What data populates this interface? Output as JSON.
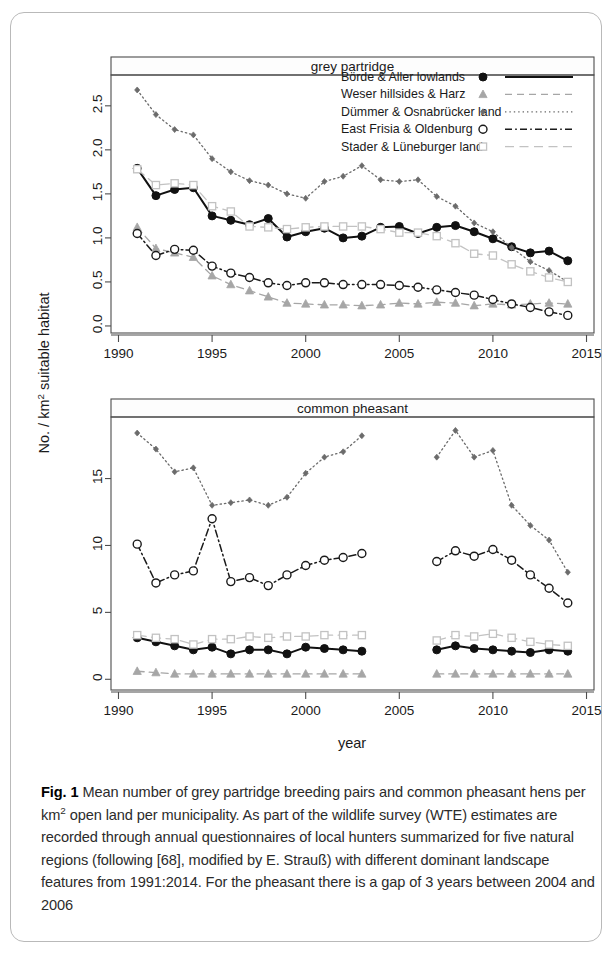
{
  "figure": {
    "label": "Fig. 1",
    "caption": "Mean number of grey partridge breeding pairs and common pheasant hens per km² open land per municipality. As part of the wildlife survey (WTE) estimates are recorded through annual questionnaires of local hunters summarized for five natural regions (following [68], modified by E. Strauß) with different dominant landscape features from 1991:2014. For the pheasant there is a gap of 3 years between 2004 and 2006",
    "caption_parts": {
      "before_sup": "Mean number of grey partridge breeding pairs and common pheasant hens per km",
      "sup": "2",
      "after_sup": " open land per municipality. As part of the wildlife survey (WTE) estimates are recorded through annual questionnaires of local hunters summarized for five natural regions (following [68], modified by E. Strauß) with different dominant landscape features from 1991:2014. For the pheasant there is a gap of 3 years between 2004 and 2006"
    }
  },
  "axes": {
    "ylabel_prefix": "No. / km",
    "ylabel_sup": "2",
    "ylabel_suffix": " suitable habitat",
    "ylabel_full": "No. / km² suitable habitat",
    "xlabel": "year"
  },
  "legend": {
    "position": "top-panel-upper-right",
    "entries": [
      {
        "label": "Börde & Aller lowlands",
        "marker": "filled-circle",
        "line": "solid",
        "color": "#111111"
      },
      {
        "label": "Weser hillsides & Harz",
        "marker": "filled-triangle",
        "line": "dashed",
        "color": "#a6a6a6"
      },
      {
        "label": "Dümmer & Osnabrücker land",
        "marker": "small-diamond",
        "line": "dotted",
        "color": "#6b6b6b"
      },
      {
        "label": "East Frisia & Oldenburg",
        "marker": "open-circle",
        "line": "dashdot",
        "color": "#1a1a1a"
      },
      {
        "label": "Stader & Lüneburger land",
        "marker": "open-square",
        "line": "longdash",
        "color": "#c2c2c2"
      }
    ]
  },
  "chart_data": [
    {
      "type": "line",
      "title": "grey partridge",
      "panel": "top",
      "xlabel": "year",
      "ylabel": "No. / km² suitable habitat",
      "xlim": [
        1989.6,
        2015.4
      ],
      "ylim": [
        -0.08,
        2.85
      ],
      "xticks": [
        1990,
        1995,
        2000,
        2005,
        2010,
        2015
      ],
      "yticks": [
        0.0,
        0.5,
        1.0,
        1.5,
        2.0,
        2.5
      ],
      "ytick_labels": [
        "0.0",
        "0.5",
        "1.0",
        "1.5",
        "2.0",
        "2.5"
      ],
      "grid": false,
      "x": [
        1991,
        1992,
        1993,
        1994,
        1995,
        1996,
        1997,
        1998,
        1999,
        2000,
        2001,
        2002,
        2003,
        2004,
        2005,
        2006,
        2007,
        2008,
        2009,
        2010,
        2011,
        2012,
        2013,
        2014
      ],
      "series": [
        {
          "name": "Börde & Aller lowlands",
          "values": [
            1.79,
            1.48,
            1.55,
            1.57,
            1.25,
            1.2,
            1.15,
            1.22,
            1.01,
            1.07,
            1.11,
            1.0,
            1.02,
            1.12,
            1.13,
            1.05,
            1.12,
            1.14,
            1.07,
            0.99,
            0.9,
            0.83,
            0.85,
            0.74
          ]
        },
        {
          "name": "Weser hillsides & Harz",
          "values": [
            1.12,
            0.88,
            0.83,
            0.78,
            0.57,
            0.47,
            0.4,
            0.33,
            0.26,
            0.25,
            0.24,
            0.24,
            0.23,
            0.24,
            0.26,
            0.25,
            0.27,
            0.26,
            0.23,
            0.25,
            0.24,
            0.25,
            0.26,
            0.25
          ]
        },
        {
          "name": "Dümmer & Osnabrücker land",
          "values": [
            2.68,
            2.4,
            2.23,
            2.17,
            1.9,
            1.75,
            1.65,
            1.6,
            1.5,
            1.45,
            1.64,
            1.7,
            1.82,
            1.66,
            1.64,
            1.66,
            1.47,
            1.36,
            1.17,
            1.07,
            0.89,
            0.73,
            0.63,
            0.5
          ]
        },
        {
          "name": "East Frisia & Oldenburg",
          "values": [
            1.05,
            0.8,
            0.87,
            0.86,
            0.68,
            0.6,
            0.55,
            0.49,
            0.46,
            0.49,
            0.49,
            0.47,
            0.47,
            0.47,
            0.46,
            0.44,
            0.41,
            0.38,
            0.35,
            0.3,
            0.25,
            0.21,
            0.16,
            0.12
          ]
        },
        {
          "name": "Stader & Lüneburger land",
          "values": [
            1.78,
            1.6,
            1.62,
            1.6,
            1.36,
            1.3,
            1.13,
            1.12,
            1.1,
            1.12,
            1.13,
            1.13,
            1.13,
            1.1,
            1.06,
            1.06,
            1.02,
            0.94,
            0.82,
            0.8,
            0.7,
            0.62,
            0.55,
            0.5
          ]
        }
      ]
    },
    {
      "type": "line",
      "title": "common pheasant",
      "panel": "bottom",
      "xlabel": "year",
      "ylabel": "No. / km² suitable habitat",
      "xlim": [
        1989.6,
        2015.4
      ],
      "ylim": [
        -0.8,
        19.6
      ],
      "xticks": [
        1990,
        1995,
        2000,
        2005,
        2010,
        2015
      ],
      "yticks": [
        0,
        5,
        10,
        15
      ],
      "ytick_labels": [
        "0",
        "5",
        "10",
        "15"
      ],
      "grid": false,
      "gap_note": "gap of 3 years between 2004 and 2006",
      "x_seg1": [
        1991,
        1992,
        1993,
        1994,
        1995,
        1996,
        1997,
        1998,
        1999,
        2000,
        2001,
        2002,
        2003
      ],
      "x_seg2": [
        2007,
        2008,
        2009,
        2010,
        2011,
        2012,
        2013,
        2014
      ],
      "series": [
        {
          "name": "Börde & Aller lowlands",
          "seg1": [
            3.1,
            2.8,
            2.5,
            2.2,
            2.4,
            1.9,
            2.2,
            2.2,
            1.9,
            2.4,
            2.3,
            2.2,
            2.1
          ],
          "seg2": [
            2.2,
            2.5,
            2.3,
            2.2,
            2.1,
            2.0,
            2.2,
            2.1
          ]
        },
        {
          "name": "Weser hillsides & Harz",
          "seg1": [
            0.6,
            0.5,
            0.4,
            0.4,
            0.4,
            0.4,
            0.4,
            0.4,
            0.4,
            0.4,
            0.4,
            0.4,
            0.4
          ],
          "seg2": [
            0.4,
            0.4,
            0.4,
            0.4,
            0.4,
            0.4,
            0.4,
            0.4
          ]
        },
        {
          "name": "Dümmer & Osnabrücker land",
          "seg1": [
            18.4,
            17.2,
            15.5,
            15.8,
            13.0,
            13.2,
            13.4,
            13.0,
            13.6,
            15.4,
            16.6,
            17.0,
            18.2
          ],
          "seg2": [
            16.6,
            18.6,
            16.6,
            17.1,
            13.0,
            11.5,
            10.4,
            8.0
          ]
        },
        {
          "name": "East Frisia & Oldenburg",
          "seg1": [
            10.1,
            7.2,
            7.8,
            8.1,
            12.0,
            7.3,
            7.6,
            7.0,
            7.8,
            8.5,
            8.9,
            9.1,
            9.4
          ],
          "seg2": [
            8.8,
            9.6,
            9.2,
            9.7,
            8.9,
            7.8,
            6.8,
            5.7
          ]
        },
        {
          "name": "Stader & Lüneburger land",
          "seg1": [
            3.3,
            3.1,
            3.0,
            2.6,
            3.0,
            3.0,
            3.2,
            3.1,
            3.2,
            3.2,
            3.3,
            3.3,
            3.3
          ],
          "seg2": [
            2.9,
            3.3,
            3.2,
            3.4,
            3.1,
            2.8,
            2.6,
            2.5
          ]
        }
      ]
    }
  ]
}
